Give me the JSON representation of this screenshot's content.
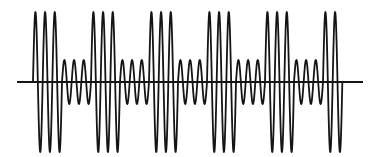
{
  "diagram": {
    "type": "ask-modulated-waveform",
    "description": "Amplitude-shift keyed sinusoidal carrier over a horizontal time axis",
    "colors": {
      "background": "#ffffff",
      "stroke": "#151515"
    },
    "axis": {
      "y": 82,
      "x_start": 17,
      "x_end": 363,
      "stroke_width": 2
    },
    "carrier": {
      "x_start": 33,
      "period_px": 9.667,
      "stroke_width": 1.8,
      "cycles_per_block": 3
    },
    "amplitudes": {
      "high": 70,
      "low": 22
    },
    "blocks": [
      {
        "level": "high",
        "cycles": 3
      },
      {
        "level": "low",
        "cycles": 3
      },
      {
        "level": "high",
        "cycles": 3
      },
      {
        "level": "low",
        "cycles": 3
      },
      {
        "level": "high",
        "cycles": 3
      },
      {
        "level": "low",
        "cycles": 3
      },
      {
        "level": "high",
        "cycles": 3
      },
      {
        "level": "low",
        "cycles": 3
      },
      {
        "level": "high",
        "cycles": 3
      },
      {
        "level": "low",
        "cycles": 3
      },
      {
        "level": "high",
        "cycles": 2
      }
    ],
    "bit_sequence": "10101010101"
  }
}
